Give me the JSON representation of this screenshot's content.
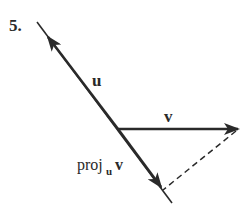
{
  "problem": {
    "number": "5."
  },
  "labels": {
    "u": "u",
    "v": "v",
    "proj_main": "proj",
    "proj_sub": "u",
    "proj_vec": "v"
  },
  "colors": {
    "line": "#2a2a2a",
    "background": "#ffffff"
  },
  "geometry": {
    "line_u": {
      "x1": 37,
      "y1": 22,
      "x2": 172,
      "y2": 203
    },
    "arrow_u_tip": {
      "x": 47,
      "y": 36
    },
    "origin": {
      "x": 118,
      "y": 129
    },
    "vector_v_tip": {
      "x": 238,
      "y": 129
    },
    "proj_tip": {
      "x": 161,
      "y": 187
    },
    "dashed_from": {
      "x": 238,
      "y": 129
    },
    "dashed_to": {
      "x": 163,
      "y": 190
    }
  }
}
